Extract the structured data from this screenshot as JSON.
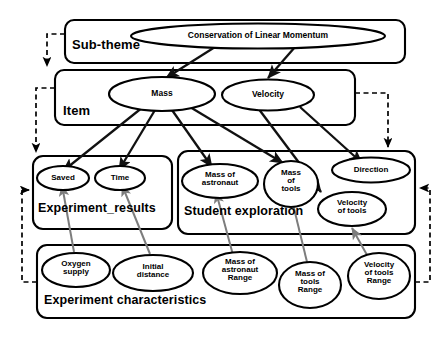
{
  "diagram": {
    "type": "hierarchy-layer-diagram",
    "colors": {
      "node_stroke": "#000000",
      "group_stroke": "#000000",
      "solid_arrow": "#1a1a1a",
      "gray_arrow": "#808080",
      "dashed_arrow": "#000000",
      "background": "#ffffff"
    },
    "layers": [
      {
        "id": "sub-theme",
        "label": "Sub-theme"
      },
      {
        "id": "item",
        "label": "Item"
      },
      {
        "id": "experiment-results",
        "label": "Experiment_results"
      },
      {
        "id": "student-exploration",
        "label": "Student exploration"
      },
      {
        "id": "experiment-characteristics",
        "label": "Experiment characteristics"
      }
    ],
    "nodes": [
      {
        "id": "conservation",
        "label": "Conservation of Linear Momentum",
        "layer": "sub-theme"
      },
      {
        "id": "mass",
        "label": "Mass",
        "layer": "item"
      },
      {
        "id": "velocity",
        "label": "Velocity",
        "layer": "item"
      },
      {
        "id": "saved",
        "label": "Saved",
        "layer": "experiment-results"
      },
      {
        "id": "time",
        "label": "Time",
        "layer": "experiment-results"
      },
      {
        "id": "mass-astronaut",
        "label": "Mass of\nastronaut",
        "layer": "student-exploration"
      },
      {
        "id": "mass-tools",
        "label": "Mass\nof\ntools",
        "layer": "student-exploration"
      },
      {
        "id": "direction",
        "label": "Direction",
        "layer": "student-exploration"
      },
      {
        "id": "velocity-tools",
        "label": "Velocity\nof tools",
        "layer": "student-exploration"
      },
      {
        "id": "oxygen-supply",
        "label": "Oxygen\nsupply",
        "layer": "experiment-characteristics"
      },
      {
        "id": "initial-distance",
        "label": "Initial\ndistance",
        "layer": "experiment-characteristics"
      },
      {
        "id": "mass-astronaut-range",
        "label": "Mass of\nastronaut\nRange",
        "layer": "experiment-characteristics"
      },
      {
        "id": "mass-tools-range",
        "label": "Mass of\ntools\nRange",
        "layer": "experiment-characteristics"
      },
      {
        "id": "velocity-tools-range",
        "label": "Velocity\nof tools\nRange",
        "layer": "experiment-characteristics"
      }
    ],
    "edges": [
      {
        "from": "conservation",
        "to": "mass",
        "style": "solid"
      },
      {
        "from": "conservation",
        "to": "velocity",
        "style": "solid"
      },
      {
        "from": "mass",
        "to": "saved",
        "style": "solid"
      },
      {
        "from": "mass",
        "to": "time",
        "style": "solid"
      },
      {
        "from": "mass",
        "to": "mass-astronaut",
        "style": "solid"
      },
      {
        "from": "mass",
        "to": "mass-tools",
        "style": "solid"
      },
      {
        "from": "velocity",
        "to": "velocity-tools",
        "style": "solid"
      },
      {
        "from": "velocity",
        "to": "direction",
        "style": "solid"
      },
      {
        "from": "oxygen-supply",
        "to": "saved",
        "style": "gray"
      },
      {
        "from": "initial-distance",
        "to": "time",
        "style": "gray"
      },
      {
        "from": "mass-astronaut-range",
        "to": "mass-astronaut",
        "style": "gray"
      },
      {
        "from": "mass-tools-range",
        "to": "mass-tools",
        "style": "gray"
      },
      {
        "from": "velocity-tools-range",
        "to": "velocity-tools",
        "style": "gray"
      },
      {
        "from": "sub-theme",
        "to": "item",
        "style": "dashed"
      },
      {
        "from": "item",
        "to": "experiment-results",
        "style": "dashed"
      },
      {
        "from": "item",
        "to": "student-exploration",
        "style": "dashed"
      },
      {
        "from": "experiment-characteristics",
        "to": "experiment-results",
        "style": "dashed"
      },
      {
        "from": "experiment-characteristics",
        "to": "student-exploration",
        "style": "dashed"
      }
    ]
  },
  "labels": {
    "sub_theme": "Sub-theme",
    "item": "Item",
    "experiment_results": "Experiment_results",
    "student_exploration": "Student exploration",
    "experiment_characteristics": "Experiment characteristics",
    "conservation": "Conservation of Linear Momentum",
    "mass": "Mass",
    "velocity": "Velocity",
    "saved": "Saved",
    "time": "Time",
    "mass_of_astronaut_l1": "Mass of",
    "mass_of_astronaut_l2": "astronaut",
    "mass_of_tools_l1": "Mass",
    "mass_of_tools_l2": "of",
    "mass_of_tools_l3": "tools",
    "direction": "Direction",
    "velocity_of_tools_l1": "Velocity",
    "velocity_of_tools_l2": "of tools",
    "oxygen_l1": "Oxygen",
    "oxygen_l2": "supply",
    "initial_l1": "Initial",
    "initial_l2": "distance",
    "mar_l1": "Mass of",
    "mar_l2": "astronaut",
    "mar_l3": "Range",
    "mtr_l1": "Mass of",
    "mtr_l2": "tools",
    "mtr_l3": "Range",
    "vtr_l1": "Velocity",
    "vtr_l2": "of tools",
    "vtr_l3": "Range"
  }
}
